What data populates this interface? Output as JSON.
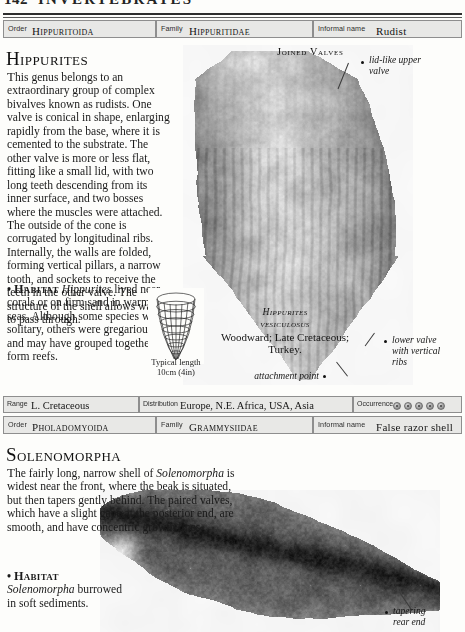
{
  "running_head": {
    "folio": "142",
    "title": "INVERTEBRATES"
  },
  "entries": [
    {
      "id": "hippurites",
      "taxon_bar": {
        "order_label": "Order",
        "order_value": "Hippuritoida",
        "family_label": "Family",
        "family_value": "Hippuritidae",
        "informal_label": "Informal name",
        "informal_value": "Rudist"
      },
      "title": "Hippurites",
      "description_lead": "T",
      "description": "his genus belongs to an extraordinary group of complex bivalves known as rudists. One valve is conical in shape, enlarging rapidly from the base, where it is cemented to the substrate. The other valve is more or less flat, fitting like a small lid, with two long teeth descending from its inner surface, and two bosses where the muscles were attached. The outside of the cone is corrugated by longitudinal ribs. Internally, the walls are folded, forming vertical pillars, a narrow tooth, and sockets to receive the teeth in the other valve. The structure of the shell allows water to pass through.",
      "habitat_bullet": "•",
      "habitat_label": "Habitat",
      "habitat_genus": "Hippurites",
      "habitat_text": " lived near corals or on firm sand in warm seas. Although some species were solitary, others were gregarious and may have grouped together to form reefs.",
      "photo_subhead": "Joined Valves",
      "specimen_caption": {
        "genus": "Hippurites",
        "species": "vesiculosus",
        "detail": "Woodward; Late Cretaceous; Turkey."
      },
      "scale_caption": "Typical length\n10cm (4in)",
      "callouts": [
        {
          "name": "lid-like-upper-valve",
          "text": "lid-like upper\nvalve"
        },
        {
          "name": "lower-valve-with-vertical-ribs",
          "text": "lower valve\nwith vertical\nribs"
        },
        {
          "name": "attachment-point",
          "text": "attachment point"
        }
      ],
      "data_bar": {
        "range_label": "Range",
        "range_value": "L. Cretaceous",
        "distribution_label": "Distribution",
        "distribution_value": "Europe, N.E. Africa, USA, Asia",
        "occurrence_label": "Occurrence",
        "occurrence_dots": 5
      }
    },
    {
      "id": "solenomorpha",
      "taxon_bar": {
        "order_label": "Order",
        "order_value": "Pholadomyoida",
        "family_label": "Family",
        "family_value": "Grammysiidae",
        "informal_label": "Informal name",
        "informal_value": "False razor shell"
      },
      "title": "Solenomorpha",
      "description_lead": "T",
      "description_pre": "he fairly long, narrow shell of ",
      "description_genus": "Solenomorpha",
      "description_post": " is widest near the front, where the beak is situated, but then tapers gently behind. The paired valves, which have a slight gape at the posterior end, are smooth, and have concentric growth lines.",
      "habitat_bullet": "•",
      "habitat_label": "Habitat",
      "habitat_genus": "Solenomorpha",
      "habitat_text": " burrowed in soft sediments.",
      "callouts": [
        {
          "name": "tapering-rear-end",
          "text": "tapering\nrear end"
        }
      ]
    }
  ]
}
